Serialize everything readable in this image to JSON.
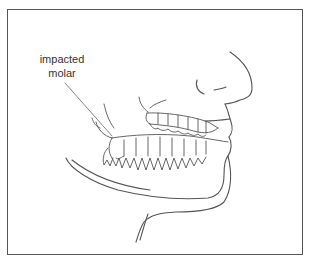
{
  "figure": {
    "label": {
      "line1": "impacted",
      "line2": "molar"
    },
    "colors": {
      "line": "#555555",
      "frame": "#555555",
      "text": "#333333",
      "background": "#ffffff"
    }
  }
}
